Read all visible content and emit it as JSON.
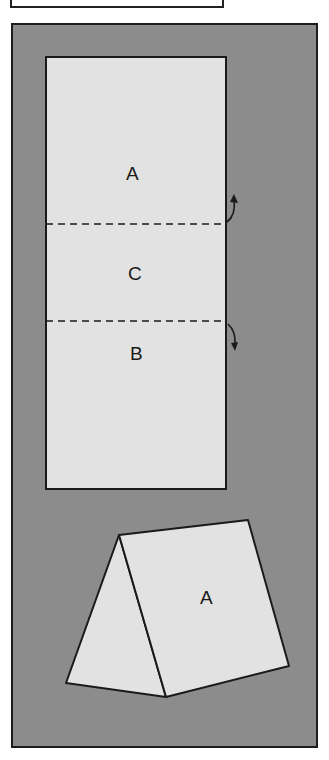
{
  "diagram": {
    "colors": {
      "background": "#8c8c8c",
      "paper": "#e2e2e2",
      "line": "#1a1a1a"
    },
    "flat_sheet": {
      "sections": [
        {
          "label": "A",
          "x": 134,
          "y": 179
        },
        {
          "label": "C",
          "x": 136,
          "y": 279
        },
        {
          "label": "B",
          "x": 138,
          "y": 359
        }
      ],
      "fold_lines": [
        {
          "y": 224,
          "direction": "up"
        },
        {
          "y": 321,
          "direction": "down"
        }
      ]
    },
    "folded_tent": {
      "label": "A"
    }
  }
}
